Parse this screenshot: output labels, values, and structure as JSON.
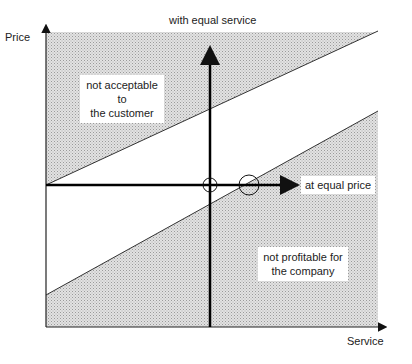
{
  "diagram": {
    "y_axis_label": "Price",
    "x_axis_label": "Service",
    "vertical_arrow_label": "with equal service",
    "horizontal_arrow_label": "at equal price",
    "upper_region_label_line1": "not acceptable to",
    "upper_region_label_line2": "the customer",
    "lower_region_label_line1": "not profitable for",
    "lower_region_label_line2": "the company",
    "colors": {
      "shade": "#d4d4d4",
      "line": "#111111",
      "background": "#ffffff"
    }
  }
}
